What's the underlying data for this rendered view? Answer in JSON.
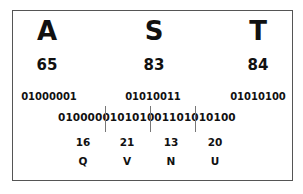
{
  "input_chars": [
    {
      "char": "A",
      "code": "65",
      "binary": "01000001"
    },
    {
      "char": "S",
      "code": "83",
      "binary": "01010011"
    },
    {
      "char": "T",
      "code": "84",
      "binary": "01010100"
    }
  ],
  "sextets": [
    {
      "bits": "010000",
      "value": "16",
      "char": "Q"
    },
    {
      "bits": "010101",
      "value": "21",
      "char": "V"
    },
    {
      "bits": "001101",
      "value": "13",
      "char": "N"
    },
    {
      "bits": "010100",
      "value": "20",
      "char": "U"
    }
  ]
}
